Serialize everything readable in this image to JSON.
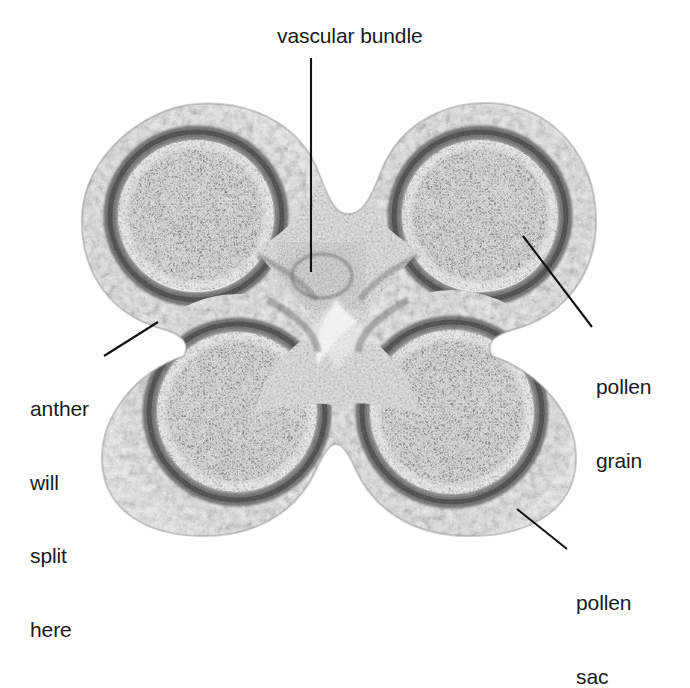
{
  "figure": {
    "kind": "light-micrograph",
    "background_color": "#ffffff",
    "ink_color": "#1a1a1a",
    "tone": "grayscale"
  },
  "labels": {
    "vascular_bundle": "vascular bundle",
    "anther_will_split_here": {
      "line1": "anther",
      "line2": "will",
      "line3": "split",
      "line4": "here"
    },
    "pollen_grain": {
      "line1": "pollen",
      "line2": "grain"
    },
    "pollen_sac": {
      "line1": "pollen",
      "line2": "sac"
    }
  },
  "leaders": [
    {
      "name": "vascular-bundle-leader",
      "x1": 311,
      "y1": 58,
      "x2": 311,
      "y2": 272
    },
    {
      "name": "anther-split-leader",
      "x1": 158,
      "y1": 322,
      "x2": 104,
      "y2": 356
    },
    {
      "name": "pollen-grain-leader",
      "x1": 523,
      "y1": 236,
      "x2": 592,
      "y2": 327
    },
    {
      "name": "pollen-sac-leader",
      "x1": 517,
      "y1": 509,
      "x2": 567,
      "y2": 549
    }
  ],
  "specimen": {
    "lobes": [
      {
        "name": "upper-left-pollen-sac",
        "cx": 196,
        "cy": 222,
        "rx": 115,
        "ry": 112
      },
      {
        "name": "upper-right-pollen-sac",
        "cx": 480,
        "cy": 222,
        "rx": 115,
        "ry": 112
      },
      {
        "name": "lower-left-pollen-sac",
        "cx": 237,
        "cy": 414,
        "rx": 115,
        "ry": 118
      },
      {
        "name": "lower-right-pollen-sac",
        "cx": 452,
        "cy": 414,
        "rx": 118,
        "ry": 122
      }
    ],
    "connective": {
      "name": "central-connective",
      "cx": 338,
      "cy": 300
    },
    "vascular_bundle": {
      "cx": 322,
      "cy": 276,
      "r": 34
    }
  }
}
